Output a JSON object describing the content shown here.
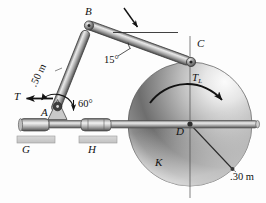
{
  "figure": {
    "type": "mechanism-diagram",
    "caption": "Linkage ABC driving flywheel K about bearing D",
    "background_color": "#fdfdfd",
    "ink_color": "#1a1a1a",
    "metal_color": "#b4b4b4",
    "wheel_light": "#f2f2f2",
    "wheel_dark": "#4a4a4a"
  },
  "labels": {
    "point_a": "A",
    "point_b": "B",
    "point_c": "C",
    "point_d": "D",
    "point_g": "G",
    "point_h": "H",
    "wheel_k": "K",
    "torque_t": "T",
    "torque_tl": "T",
    "torque_tl_sub": "L",
    "length_ab": ".50 m",
    "radius_wheel": ".30 m",
    "angle_a": "60°",
    "angle_b": "15°"
  },
  "geometry": {
    "a": [
      57,
      105
    ],
    "b": [
      89,
      25
    ],
    "c": [
      191,
      62
    ],
    "d": [
      190,
      124
    ],
    "g": [
      26,
      123
    ],
    "h": [
      92,
      123
    ],
    "wheel_center": [
      190,
      124
    ],
    "wheel_radius": 62,
    "angle_a_deg": 60,
    "angle_b_deg": 15
  },
  "annotations": {
    "horizontal_reference": true,
    "pointer_arrow": true,
    "rotation_arrow_direction": "clockwise"
  }
}
